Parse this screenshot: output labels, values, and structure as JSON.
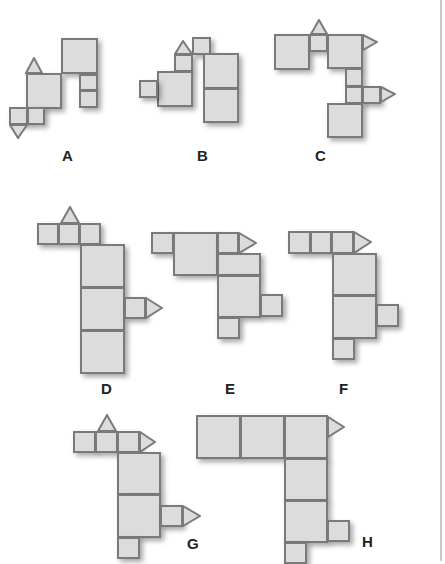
{
  "figures": [
    {
      "label": "A"
    },
    {
      "label": "B"
    },
    {
      "label": "C"
    },
    {
      "label": "D"
    },
    {
      "label": "E"
    },
    {
      "label": "F"
    },
    {
      "label": "G"
    },
    {
      "label": "H"
    }
  ],
  "colors": {
    "face": "#dcdcdc",
    "edge": "#7a7a7a",
    "shadow": "#555555",
    "text": "#222222"
  }
}
